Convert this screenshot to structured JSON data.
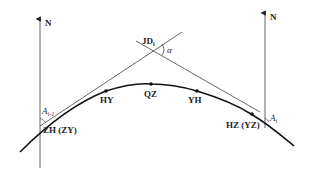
{
  "diagram": {
    "north_left": {
      "label": "N"
    },
    "north_right": {
      "label": "N"
    },
    "intersection": {
      "label": "JD",
      "subscript": "i",
      "angle_label": "α"
    },
    "points": {
      "zh": {
        "label": "ZH (ZY)"
      },
      "hy": {
        "label": "HY"
      },
      "qz": {
        "label": "QZ"
      },
      "yh": {
        "label": "YH"
      },
      "hz": {
        "label": "HZ (YZ)"
      }
    },
    "azimuth_left": {
      "label": "A",
      "subscript": "i-1"
    },
    "azimuth_right": {
      "label": "A",
      "subscript": "i"
    }
  }
}
